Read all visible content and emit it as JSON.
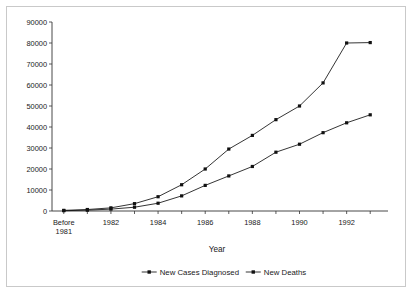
{
  "chart_data": {
    "type": "line",
    "title": "",
    "xlabel": "Year",
    "ylabel": "",
    "ylim": [
      0,
      90000
    ],
    "ytick_step": 10000,
    "yticks": [
      "0",
      "10000",
      "20000",
      "30000",
      "40000",
      "50000",
      "60000",
      "70000",
      "80000",
      "90000"
    ],
    "grid": false,
    "legend_position": "bottom",
    "categories": [
      "Before 1981",
      "1981",
      "1982",
      "1983",
      "1984",
      "1985",
      "1986",
      "1987",
      "1988",
      "1989",
      "1990",
      "1991",
      "1992",
      "1993"
    ],
    "xtick_labels": [
      "Before\n1981",
      "",
      "1982",
      "",
      "1984",
      "",
      "1986",
      "",
      "1988",
      "",
      "1990",
      "",
      "1992",
      ""
    ],
    "xtick_labels_visible": [
      {
        "index": 0,
        "line1": "Before",
        "line2": "1981"
      },
      {
        "index": 2,
        "line1": "1982",
        "line2": ""
      },
      {
        "index": 4,
        "line1": "1984",
        "line2": ""
      },
      {
        "index": 6,
        "line1": "1986",
        "line2": ""
      },
      {
        "index": 8,
        "line1": "1988",
        "line2": ""
      },
      {
        "index": 10,
        "line1": "1990",
        "line2": ""
      },
      {
        "index": 12,
        "line1": "1992",
        "line2": ""
      }
    ],
    "series": [
      {
        "name": "New Cases Diagnosed",
        "marker": "square",
        "color": "#111111",
        "values": [
          300,
          700,
          1500,
          3500,
          6800,
          12500,
          20000,
          29500,
          36000,
          43500,
          50000,
          61000,
          80000,
          80200
        ]
      },
      {
        "name": "New Deaths",
        "marker": "square",
        "color": "#111111",
        "values": [
          150,
          400,
          900,
          1800,
          3700,
          7200,
          12200,
          16700,
          21200,
          28000,
          31800,
          37300,
          42000,
          45800
        ]
      }
    ]
  },
  "legend": {
    "items": [
      {
        "label": "New Cases Diagnosed",
        "marker": "square-line-marker"
      },
      {
        "label": "New Deaths",
        "marker": "square-line-marker"
      }
    ]
  },
  "axis": {
    "x_title": "Year"
  },
  "colors": {
    "frame": "#c9c9c9",
    "axis": "#333333",
    "series": "#111111",
    "text": "#1a1a1a",
    "background": "#ffffff"
  }
}
